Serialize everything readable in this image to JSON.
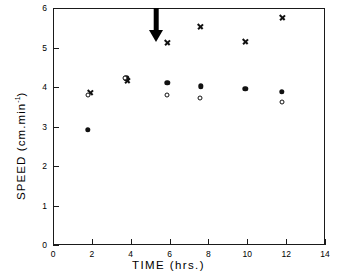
{
  "chart_data": {
    "type": "scatter",
    "title": "",
    "xlabel": "TIME  (hrs.)",
    "ylabel": "SPEED  (cm.min",
    "ylabel_exponent": "-1",
    "ylabel_close": ")",
    "xlim": [
      0,
      14
    ],
    "ylim": [
      0,
      6
    ],
    "xticks": [
      0,
      2,
      4,
      6,
      8,
      10,
      12,
      14
    ],
    "yticks": [
      0,
      1,
      2,
      3,
      4,
      5,
      6
    ],
    "grid": false,
    "legend": "none",
    "series": [
      {
        "name": "cross",
        "marker": "x",
        "points": [
          {
            "x": 1.95,
            "y": 3.85
          },
          {
            "x": 3.85,
            "y": 4.17
          },
          {
            "x": 5.9,
            "y": 5.12
          },
          {
            "x": 7.6,
            "y": 5.52
          },
          {
            "x": 9.9,
            "y": 5.15
          },
          {
            "x": 11.8,
            "y": 5.75
          }
        ]
      },
      {
        "name": "filled-circle",
        "marker": "filled",
        "points": [
          {
            "x": 1.8,
            "y": 2.92
          },
          {
            "x": 3.78,
            "y": 4.22
          },
          {
            "x": 5.88,
            "y": 4.1
          },
          {
            "x": 7.6,
            "y": 4.02
          },
          {
            "x": 9.9,
            "y": 3.95
          },
          {
            "x": 11.78,
            "y": 3.88
          }
        ]
      },
      {
        "name": "open-circle",
        "marker": "open",
        "points": [
          {
            "x": 1.78,
            "y": 3.8
          },
          {
            "x": 3.7,
            "y": 4.22
          },
          {
            "x": 5.85,
            "y": 3.81
          },
          {
            "x": 7.58,
            "y": 3.71
          },
          {
            "x": 11.8,
            "y": 3.62
          }
        ]
      }
    ],
    "annotations": [
      {
        "type": "arrow",
        "label": "down-arrow",
        "x": 5.3,
        "y_top": 6.0,
        "direction": "down"
      }
    ]
  }
}
